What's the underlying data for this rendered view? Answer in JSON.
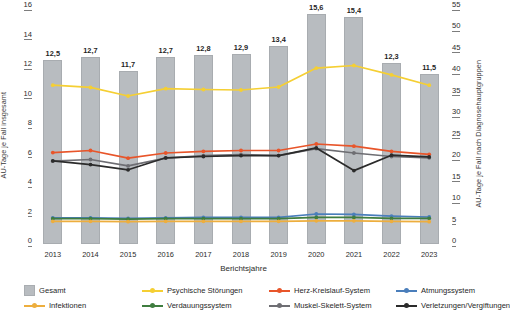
{
  "axes": {
    "left_title": "AU-Tage je Fall insgesamt",
    "right_title": "AU-Tage je Fall nach Diagnosehauptgruppen",
    "x_title": "Berichtsjahre",
    "left_ticks": [
      "16",
      "14",
      "12",
      "10",
      "8",
      "6",
      "4",
      "2",
      "0"
    ],
    "right_ticks": [
      "55",
      "50",
      "45",
      "40",
      "35",
      "30",
      "25",
      "20",
      "15",
      "10",
      "5",
      "0"
    ]
  },
  "legend": {
    "items": [
      {
        "label": "Gesamt",
        "color": "#b8bcc0",
        "marker": "box"
      },
      {
        "label": "Psychische Störungen",
        "color": "#f5cf33",
        "marker": "line"
      },
      {
        "label": "Herz-Kreislauf-System",
        "color": "#e8552a",
        "marker": "line"
      },
      {
        "label": "Atmungssystem",
        "color": "#4a7ebb",
        "marker": "line"
      },
      {
        "label": "Infektionen",
        "color": "#edae3e",
        "marker": "line"
      },
      {
        "label": "Verdauungssystem",
        "color": "#3f7d3f",
        "marker": "line"
      },
      {
        "label": "Muskel-Skelett-System",
        "color": "#6e6e73",
        "marker": "line"
      },
      {
        "label": "Verletzungen/Vergiftungen",
        "color": "#2b2b2b",
        "marker": "line"
      }
    ]
  },
  "chart_data": {
    "type": "bar",
    "title": "",
    "xlabel": "Berichtsjahre",
    "ylabel": "AU-Tage je Fall insgesamt",
    "y2label": "AU-Tage je Fall nach Diagnosehauptgruppen",
    "categories": [
      "2013",
      "2014",
      "2015",
      "2016",
      "2017",
      "2018",
      "2019",
      "2020",
      "2021",
      "2022",
      "2023"
    ],
    "ylim": [
      0,
      16
    ],
    "y2lim": [
      0,
      55
    ],
    "grid": false,
    "legend_position": "bottom",
    "bars": {
      "name": "Gesamt",
      "axis": "left",
      "color": "#b8bcc0",
      "values": [
        12.5,
        12.7,
        11.7,
        12.7,
        12.8,
        12.9,
        13.4,
        15.6,
        15.4,
        12.3,
        11.5
      ],
      "labels": [
        "12,5",
        "12,7",
        "11,7",
        "12,7",
        "12,8",
        "12,9",
        "13,4",
        "15,6",
        "15,4",
        "12,3",
        "11,5"
      ]
    },
    "series": [
      {
        "name": "Psychische Störungen",
        "axis": "right",
        "color": "#f5cf33",
        "values": [
          37.0,
          36.5,
          34.5,
          36.2,
          36.0,
          35.9,
          36.6,
          41.0,
          41.6,
          39.4,
          37.0
        ]
      },
      {
        "name": "Herz-Kreislauf-System",
        "axis": "right",
        "color": "#e8552a",
        "values": [
          21.3,
          21.8,
          20.0,
          21.2,
          21.6,
          21.8,
          21.8,
          23.3,
          22.8,
          21.6,
          20.9
        ]
      },
      {
        "name": "Muskel-Skelett-System",
        "axis": "right",
        "color": "#6e6e73",
        "values": [
          19.3,
          19.7,
          18.2,
          20.0,
          20.6,
          20.8,
          20.6,
          22.2,
          21.2,
          20.4,
          20.1
        ]
      },
      {
        "name": "Verletzungen/Vergiftungen",
        "axis": "right",
        "color": "#2b2b2b",
        "values": [
          19.4,
          18.5,
          17.3,
          20.1,
          20.4,
          20.6,
          20.6,
          22.4,
          17.1,
          20.7,
          20.3
        ]
      },
      {
        "name": "Atmungssystem",
        "axis": "right",
        "color": "#4a7ebb",
        "values": [
          6.1,
          6.1,
          6.0,
          6.1,
          6.2,
          6.2,
          6.2,
          7.0,
          6.9,
          6.5,
          6.3
        ]
      },
      {
        "name": "Verdauungssystem",
        "axis": "right",
        "color": "#3f7d3f",
        "values": [
          5.9,
          5.9,
          5.8,
          5.9,
          5.9,
          5.9,
          5.9,
          6.2,
          6.2,
          6.0,
          6.0
        ]
      },
      {
        "name": "Infektionen",
        "axis": "right",
        "color": "#edae3e",
        "values": [
          5.3,
          5.3,
          5.2,
          5.3,
          5.3,
          5.3,
          5.3,
          5.4,
          5.4,
          5.3,
          5.2
        ]
      }
    ]
  }
}
